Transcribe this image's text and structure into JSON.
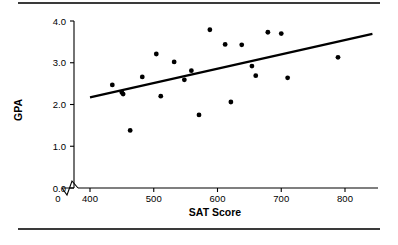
{
  "figure": {
    "name": "sat-gpa-scatterplot",
    "background_color": "#ffffff",
    "rule_color": "#3a3a3a",
    "marker_color": "#000000",
    "line_color": "#000000"
  },
  "chart_data": {
    "type": "scatter",
    "title": "",
    "xlabel": "SAT Score",
    "ylabel": "GPA",
    "xlim": [
      370,
      840
    ],
    "ylim": [
      0.0,
      4.0
    ],
    "grid": false,
    "legend": null,
    "axis_break": {
      "axis": "x",
      "between": [
        0,
        400
      ],
      "symbol": "zigzag"
    },
    "xticks": [
      0,
      400,
      500,
      600,
      700,
      800
    ],
    "xticklabels": [
      "0",
      "400",
      "500",
      "600",
      "700",
      "800"
    ],
    "yticks": [
      0.0,
      1.0,
      2.0,
      3.0,
      4.0
    ],
    "yticklabels": [
      "0.0",
      "1.0",
      "2.0",
      "3.0",
      "4.0"
    ],
    "points": [
      {
        "x": 435,
        "y": 2.47
      },
      {
        "x": 450,
        "y": 2.29
      },
      {
        "x": 452,
        "y": 2.25
      },
      {
        "x": 463,
        "y": 1.38
      },
      {
        "x": 482,
        "y": 2.66
      },
      {
        "x": 504,
        "y": 3.21
      },
      {
        "x": 511,
        "y": 2.2
      },
      {
        "x": 532,
        "y": 3.02
      },
      {
        "x": 548,
        "y": 2.59
      },
      {
        "x": 559,
        "y": 2.81
      },
      {
        "x": 571,
        "y": 1.75
      },
      {
        "x": 588,
        "y": 3.79
      },
      {
        "x": 612,
        "y": 3.44
      },
      {
        "x": 621,
        "y": 2.06
      },
      {
        "x": 638,
        "y": 3.43
      },
      {
        "x": 654,
        "y": 2.92
      },
      {
        "x": 660,
        "y": 2.69
      },
      {
        "x": 679,
        "y": 3.73
      },
      {
        "x": 700,
        "y": 3.7
      },
      {
        "x": 710,
        "y": 2.64
      },
      {
        "x": 789,
        "y": 3.13
      }
    ],
    "fit_line": {
      "label": "least-squares regression line",
      "x_start": 400,
      "y_start": 2.17,
      "x_end": 843,
      "y_end": 3.69
    }
  },
  "labels": {
    "x_axis_title": "SAT Score",
    "y_axis_title": "GPA"
  }
}
